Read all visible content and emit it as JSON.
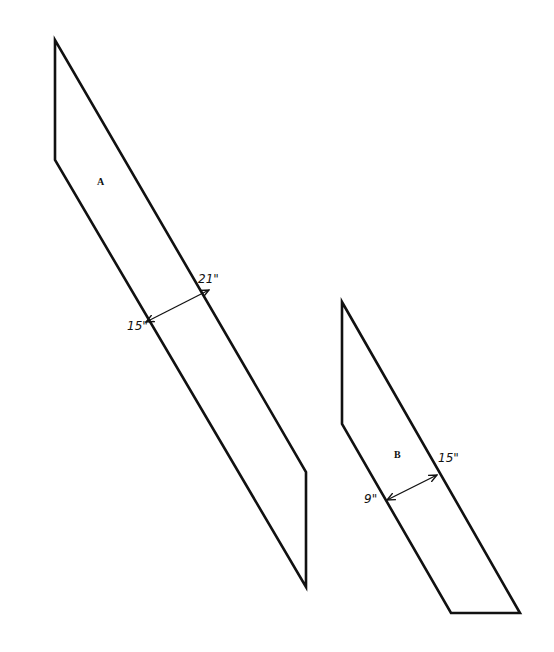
{
  "diagram": {
    "shapes": [
      {
        "id": "A",
        "label": "A",
        "points": "55,40 55,160 306,587 306,472",
        "label_pos": [
          97,
          185
        ],
        "dimension": {
          "from": [
            146,
            322
          ],
          "to": [
            209,
            290
          ],
          "outer_label": "21\"",
          "outer_label_pos": [
            198,
            283
          ],
          "inner_label": "15\"",
          "inner_label_pos": [
            127,
            330
          ]
        }
      },
      {
        "id": "B",
        "label": "B",
        "points": "342,302 342,424 451,613 520,613",
        "label_pos": [
          394,
          458
        ],
        "dimension": {
          "from": [
            387,
            500
          ],
          "to": [
            437,
            475
          ],
          "outer_label": "15\"",
          "outer_label_pos": [
            438,
            462
          ],
          "inner_label": "9\"",
          "inner_label_pos": [
            364,
            503
          ]
        }
      }
    ],
    "colors": {
      "stroke": "#111111",
      "background": "#ffffff"
    }
  }
}
